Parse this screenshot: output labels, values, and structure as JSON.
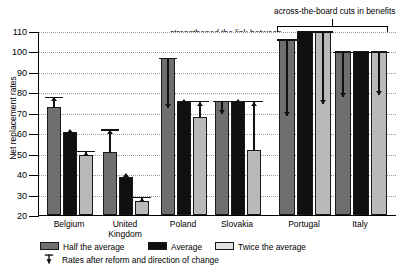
{
  "chart_data": {
    "type": "bar",
    "title": "",
    "xlabel": "",
    "ylabel": "Net replacement rates",
    "ylim": [
      20,
      110
    ],
    "yticks": [
      20,
      30,
      40,
      50,
      60,
      70,
      80,
      90,
      100,
      110
    ],
    "grid": true,
    "legend_position": "bottom",
    "categories": [
      "Belgium",
      "United\nKingdom",
      "Poland",
      "Slovakia",
      "Portugal",
      "Italy"
    ],
    "series": [
      {
        "name": "Half the average",
        "color": "#6f6f6f",
        "values": [
          73,
          51,
          97,
          76,
          106,
          100
        ]
      },
      {
        "name": "Average",
        "color": "#101010",
        "values": [
          60.5,
          38.5,
          76,
          76,
          111,
          100
        ]
      },
      {
        "name": "Twice the average",
        "color": "#b9b9b9",
        "values": [
          49.5,
          27,
          68,
          52,
          110,
          100
        ]
      }
    ],
    "after_reform": {
      "label": "Rates after reform and direction of change",
      "series": [
        {
          "name": "Half the average",
          "values": [
            78,
            62,
            73,
            70,
            69,
            78
          ]
        },
        {
          "name": "Average",
          "values": [
            62.5,
            41,
            77,
            77,
            76,
            null
          ]
        },
        {
          "name": "Twice the average",
          "values": [
            51.5,
            29,
            76,
            76,
            75,
            79
          ]
        }
      ]
    },
    "annotations": [
      {
        "text": "protecting low earners",
        "groups": [
          "Belgium",
          "United Kingdom"
        ]
      },
      {
        "text": "strengthened the link between\ncontributions and benefits",
        "groups": [
          "Poland",
          "Slovakia"
        ]
      },
      {
        "text": "across-the-board cuts in benefits",
        "groups": [
          "Portugal",
          "Italy"
        ]
      }
    ]
  },
  "axis": {
    "y_title": "Net replacement rates",
    "y_labels": [
      "110",
      "100",
      "90",
      "80",
      "70",
      "60",
      "50",
      "40",
      "30",
      "20"
    ]
  },
  "x_labels": [
    {
      "line1": "Belgium",
      "line2": ""
    },
    {
      "line1": "United",
      "line2": "Kingdom"
    },
    {
      "line1": "Poland",
      "line2": ""
    },
    {
      "line1": "Slovakia",
      "line2": ""
    },
    {
      "line1": "Portugal",
      "line2": ""
    },
    {
      "line1": "Italy",
      "line2": ""
    }
  ],
  "annotations": {
    "low_earners": "protecting low earners",
    "contributions_line1": "strengthened the link between",
    "contributions_line2": "contributions and benefits",
    "cuts": "across-the-board cuts in benefits"
  },
  "legend": {
    "half": "Half the average",
    "average": "Average",
    "twice": "Twice the average",
    "reform": "Rates after reform and direction of change"
  },
  "colors": {
    "half": "#6f6f6f",
    "average": "#101010",
    "twice": "#b9b9b9",
    "grid": "#9a9a9a",
    "axis": "#000000"
  }
}
